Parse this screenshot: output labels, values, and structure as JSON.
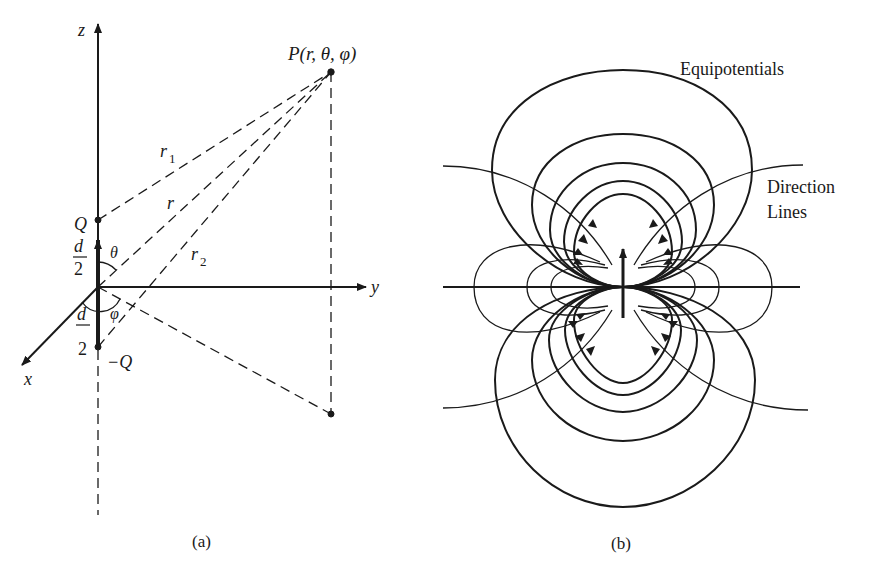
{
  "figure_a": {
    "caption": "(a)",
    "axes": {
      "z": "z",
      "y": "y",
      "x": "x"
    },
    "point_label": "P(r, θ, φ)",
    "charges": {
      "positive": "Q",
      "negative": "−Q"
    },
    "distances": {
      "r1": "r",
      "r1_sub": "1",
      "r": "r",
      "r2": "r",
      "r2_sub": "2"
    },
    "half_separation": {
      "numerator": "d",
      "denominator": "2"
    },
    "angles": {
      "theta": "θ",
      "phi": "φ"
    }
  },
  "figure_b": {
    "caption": "(b)",
    "labels": {
      "equipotentials": "Equipotentials",
      "direction_line1": "Direction",
      "direction_line2": "Lines"
    }
  },
  "colors": {
    "ink": "#1a1a1a",
    "background": "#ffffff"
  }
}
